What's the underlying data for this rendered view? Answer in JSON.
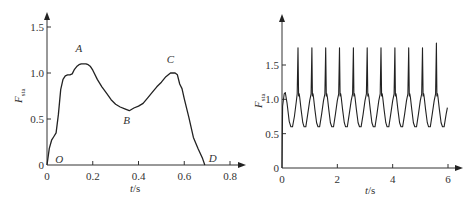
{
  "chart_data": [
    {
      "id": "left",
      "type": "line",
      "title": "",
      "xlabel": "t/s",
      "ylabel": "F_sta",
      "ylabel_main": "F",
      "ylabel_sub": "sta",
      "xlabel_var": "t",
      "xlabel_unit": "/s",
      "xlim": [
        0,
        0.85
      ],
      "ylim": [
        0,
        1.6
      ],
      "xticks": [
        0,
        0.2,
        0.4,
        0.6,
        0.8
      ],
      "xtick_labels": [
        "0",
        "0.2",
        "0.4",
        "0.6",
        "0.8"
      ],
      "yticks": [
        0,
        0.5,
        1.0,
        1.5
      ],
      "ytick_labels": [
        "0",
        "0.5",
        "1.0",
        "1.5"
      ],
      "grid": false,
      "legend": null,
      "annotations": [
        {
          "label": "O",
          "x": 0.01,
          "y": 0.0
        },
        {
          "label": "A",
          "x": 0.16,
          "y": 1.1
        },
        {
          "label": "B",
          "x": 0.36,
          "y": 0.6
        },
        {
          "label": "C",
          "x": 0.55,
          "y": 1.0
        },
        {
          "label": "D",
          "x": 0.69,
          "y": 0.0
        }
      ],
      "series": [
        {
          "name": "F_sta",
          "x": [
            0,
            0.01,
            0.02,
            0.03,
            0.04,
            0.05,
            0.06,
            0.07,
            0.08,
            0.09,
            0.1,
            0.11,
            0.12,
            0.13,
            0.14,
            0.15,
            0.16,
            0.17,
            0.18,
            0.19,
            0.2,
            0.22,
            0.24,
            0.26,
            0.28,
            0.3,
            0.32,
            0.34,
            0.36,
            0.38,
            0.4,
            0.42,
            0.44,
            0.46,
            0.48,
            0.5,
            0.52,
            0.54,
            0.55,
            0.56,
            0.57,
            0.58,
            0.59,
            0.6,
            0.62,
            0.64,
            0.66,
            0.68,
            0.69
          ],
          "y": [
            0,
            0.18,
            0.27,
            0.31,
            0.35,
            0.55,
            0.82,
            0.93,
            0.97,
            0.98,
            0.98,
            0.99,
            1.04,
            1.07,
            1.09,
            1.1,
            1.1,
            1.1,
            1.09,
            1.07,
            1.03,
            0.93,
            0.85,
            0.78,
            0.71,
            0.66,
            0.63,
            0.61,
            0.59,
            0.62,
            0.64,
            0.67,
            0.73,
            0.79,
            0.85,
            0.9,
            0.96,
            1.0,
            1.0,
            1.0,
            0.98,
            0.88,
            0.83,
            0.72,
            0.52,
            0.3,
            0.18,
            0.07,
            0.0
          ]
        }
      ]
    },
    {
      "id": "right",
      "type": "line",
      "title": "",
      "xlabel": "t/s",
      "ylabel": "F_sta",
      "ylabel_main": "F",
      "ylabel_sub": "sta",
      "xlabel_var": "t",
      "xlabel_unit": "/s",
      "xlim": [
        0,
        6.2
      ],
      "ylim": [
        0,
        2.1
      ],
      "xticks": [
        0,
        2,
        4,
        6
      ],
      "xtick_labels": [
        "0",
        "2",
        "4",
        "6"
      ],
      "yticks": [
        0,
        0.5,
        1.0,
        1.5
      ],
      "ytick_labels": [
        "0",
        "0.5",
        "1.0",
        "1.5"
      ],
      "grid": false,
      "legend": null,
      "periodic": {
        "period_s": 0.5,
        "cycles": 12,
        "start_s": 0.0,
        "end_s": 6.0,
        "peak": 1.75,
        "last_peak": 1.82,
        "shoulder": 1.05,
        "trough": 0.6,
        "initial_bump": 1.1,
        "end_value": 0.88
      },
      "series": [
        {
          "name": "F_sta (periodic gait, ~12 cycles)",
          "x": [
            0,
            0.02,
            0.08,
            0.15,
            0.25,
            0.35,
            0.45,
            0.55,
            0.58,
            0.62,
            0.65,
            0.75,
            0.85,
            0.95,
            1.05,
            1.08
          ],
          "y": [
            0,
            0.95,
            1.1,
            0.95,
            0.62,
            0.62,
            0.9,
            1.1,
            1.75,
            1.05,
            1.05,
            0.62,
            0.62,
            0.9,
            1.1,
            1.75
          ]
        }
      ]
    }
  ]
}
